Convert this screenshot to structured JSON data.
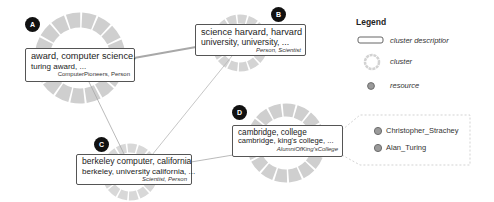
{
  "legend": {
    "title": "Legend",
    "items": [
      {
        "icon": "rounded-rect-icon",
        "label": "cluster descriptior"
      },
      {
        "icon": "dashed-ring-icon",
        "label": "cluster"
      },
      {
        "icon": "dot-icon",
        "label": "resource"
      }
    ]
  },
  "clusters": [
    {
      "id": "A",
      "line1": "award, computer science,",
      "line2": "turing award, ...",
      "types": "ComputerPioneers, Person"
    },
    {
      "id": "B",
      "line1": "science harvard, harvard",
      "line2": "university, university, ...",
      "types": "Person, Scientist"
    },
    {
      "id": "C",
      "line1": "berkeley computer, california",
      "line2": "berkeley, university california, ...",
      "types": "Scientist, Person"
    },
    {
      "id": "D",
      "line1": "cambridge, college",
      "line2": "cambridge, king's college, ...",
      "types": "AlumniOfKing'sCollege"
    }
  ],
  "resources": [
    {
      "label": "Christopher_Strachey"
    },
    {
      "label": "Alan_Turing"
    }
  ],
  "colors": {
    "ring": "#cfcfcf",
    "ring_gap": "#ffffff",
    "edge": "#a8a8a8",
    "badge": "#111111",
    "resource_fill": "#9a9a9a",
    "resource_stroke": "#6d6d6d"
  }
}
